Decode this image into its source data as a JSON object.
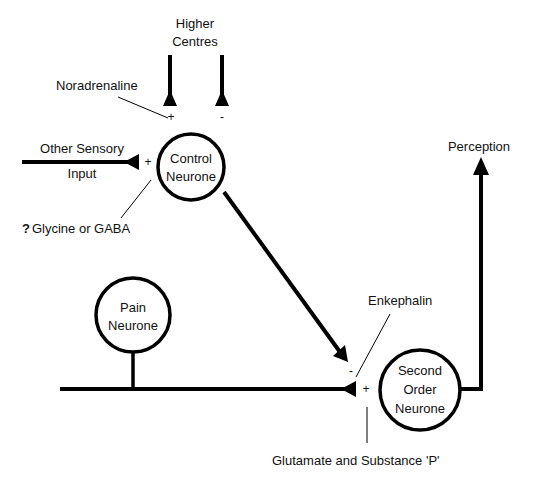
{
  "diagram": {
    "colors": {
      "stroke": "#000000",
      "text": "#111111",
      "background": "#ffffff"
    },
    "nodes": {
      "control": {
        "line1": "Control",
        "line2": "Neurone"
      },
      "pain": {
        "line1": "Pain",
        "line2": "Neurone"
      },
      "second": {
        "line1": "Second",
        "line2": "Order",
        "line3": "Neurone"
      }
    },
    "labels": {
      "higher_line1": "Higher",
      "higher_line2": "Centres",
      "noradrenaline": "Noradrenaline",
      "other_sensory_line1": "Other Sensory",
      "other_sensory_line2": "Input",
      "glycine_q": "?",
      "glycine": "Glycine or GABA",
      "perception": "Perception",
      "enkephalin": "Enkephalin",
      "glutamate": "Glutamate and Substance 'P'"
    },
    "signs": {
      "higher_plus": "+",
      "higher_minus": "-",
      "other_sensory_plus": "+",
      "enkephalin_minus": "-",
      "glutamate_plus": "+"
    }
  }
}
